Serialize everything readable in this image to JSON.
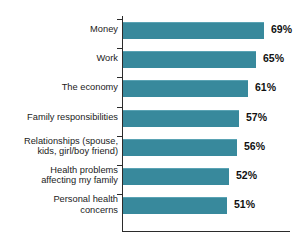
{
  "chart_data": {
    "type": "bar",
    "orientation": "horizontal",
    "title": "",
    "subtitle": "",
    "xlabel": "",
    "ylabel": "",
    "xlim": [
      0,
      75
    ],
    "grid": false,
    "legend": false,
    "value_suffix": "%",
    "categories": [
      "Money",
      "Work",
      "The economy",
      "Family responsibilities",
      "Relationships (spouse,\nkids, girl/boy friend)",
      "Health problems\naffecting my family",
      "Personal health\nconcerns"
    ],
    "values": [
      69,
      65,
      61,
      57,
      56,
      52,
      51
    ],
    "value_labels": [
      "69%",
      "65%",
      "61%",
      "57%",
      "56%",
      "52%",
      "51%"
    ],
    "bar_color": "#38899c",
    "axis_color": "#2b2b2b",
    "background_color": "#ffffff"
  },
  "bars": [
    {
      "label": "Money",
      "value": 69,
      "value_label": "69%"
    },
    {
      "label": "Work",
      "value": 65,
      "value_label": "65%"
    },
    {
      "label": "The economy",
      "value": 61,
      "value_label": "61%"
    },
    {
      "label": "Family responsibilities",
      "value": 57,
      "value_label": "57%"
    },
    {
      "label": "Relationships (spouse,\nkids, girl/boy friend)",
      "value": 56,
      "value_label": "56%"
    },
    {
      "label": "Health problems\naffecting my family",
      "value": 52,
      "value_label": "52%"
    },
    {
      "label": "Personal health\nconcerns",
      "value": 51,
      "value_label": "51%"
    }
  ]
}
